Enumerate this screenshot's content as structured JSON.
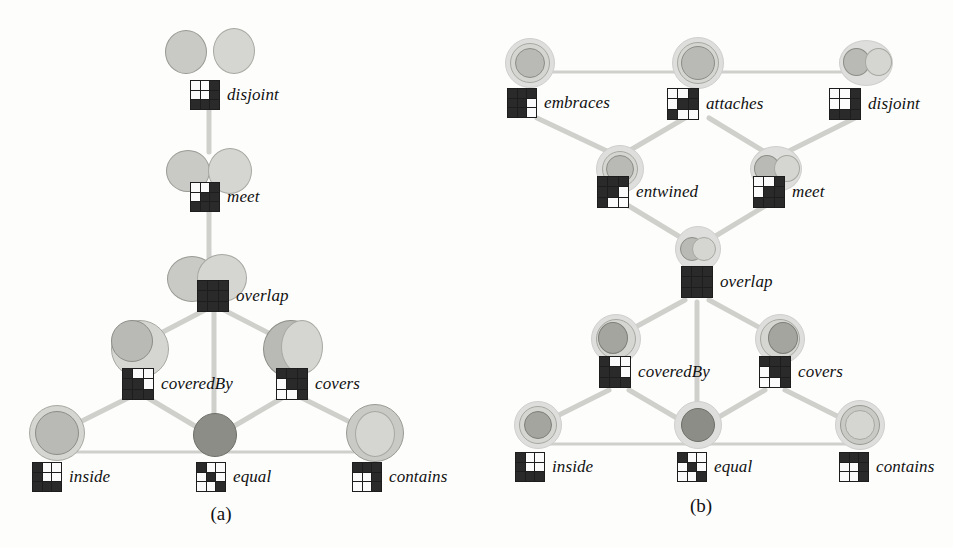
{
  "figure": {
    "panels": [
      {
        "id": "a",
        "caption": "(a)",
        "nodes": [
          {
            "key": "disjoint",
            "label": "disjoint",
            "matrix": [
              [
                0,
                0,
                1
              ],
              [
                0,
                0,
                1
              ],
              [
                1,
                1,
                1
              ]
            ]
          },
          {
            "key": "meet",
            "label": "meet",
            "matrix": [
              [
                0,
                0,
                1
              ],
              [
                0,
                1,
                1
              ],
              [
                1,
                1,
                1
              ]
            ]
          },
          {
            "key": "overlap",
            "label": "overlap",
            "matrix": [
              [
                1,
                1,
                1
              ],
              [
                1,
                1,
                1
              ],
              [
                1,
                1,
                1
              ]
            ]
          },
          {
            "key": "coveredBy",
            "label": "coveredBy",
            "matrix": [
              [
                1,
                0,
                0
              ],
              [
                1,
                1,
                0
              ],
              [
                1,
                1,
                1
              ]
            ]
          },
          {
            "key": "covers",
            "label": "covers",
            "matrix": [
              [
                1,
                1,
                1
              ],
              [
                0,
                1,
                1
              ],
              [
                0,
                0,
                1
              ]
            ]
          },
          {
            "key": "inside",
            "label": "inside",
            "matrix": [
              [
                1,
                0,
                0
              ],
              [
                1,
                0,
                0
              ],
              [
                1,
                1,
                1
              ]
            ]
          },
          {
            "key": "equal",
            "label": "equal",
            "matrix": [
              [
                1,
                0,
                0
              ],
              [
                0,
                1,
                0
              ],
              [
                0,
                0,
                1
              ]
            ]
          },
          {
            "key": "contains",
            "label": "contains",
            "matrix": [
              [
                1,
                1,
                1
              ],
              [
                0,
                0,
                1
              ],
              [
                0,
                0,
                1
              ]
            ]
          }
        ],
        "edges": [
          {
            "from": "disjoint",
            "to": "meet"
          },
          {
            "from": "meet",
            "to": "overlap"
          },
          {
            "from": "overlap",
            "to": "coveredBy"
          },
          {
            "from": "overlap",
            "to": "covers"
          },
          {
            "from": "overlap",
            "to": "equal"
          },
          {
            "from": "coveredBy",
            "to": "inside"
          },
          {
            "from": "coveredBy",
            "to": "equal"
          },
          {
            "from": "covers",
            "to": "contains"
          },
          {
            "from": "covers",
            "to": "equal"
          },
          {
            "from": "inside",
            "to": "equal"
          },
          {
            "from": "equal",
            "to": "contains"
          }
        ]
      },
      {
        "id": "b",
        "caption": "(b)",
        "nodes": [
          {
            "key": "embraces",
            "label": "embraces",
            "matrix": [
              [
                1,
                1,
                1
              ],
              [
                1,
                1,
                0
              ],
              [
                1,
                1,
                0
              ]
            ]
          },
          {
            "key": "attaches",
            "label": "attaches",
            "matrix": [
              [
                0,
                0,
                1
              ],
              [
                0,
                1,
                1
              ],
              [
                1,
                0,
                0
              ]
            ]
          },
          {
            "key": "disjoint",
            "label": "disjoint",
            "matrix": [
              [
                0,
                0,
                1
              ],
              [
                0,
                0,
                1
              ],
              [
                1,
                1,
                1
              ]
            ]
          },
          {
            "key": "entwined",
            "label": "entwined",
            "matrix": [
              [
                1,
                1,
                1
              ],
              [
                1,
                1,
                0
              ],
              [
                1,
                0,
                0
              ]
            ]
          },
          {
            "key": "meet",
            "label": "meet",
            "matrix": [
              [
                0,
                0,
                1
              ],
              [
                0,
                1,
                1
              ],
              [
                1,
                1,
                1
              ]
            ]
          },
          {
            "key": "overlap",
            "label": "overlap",
            "matrix": [
              [
                1,
                1,
                1
              ],
              [
                1,
                1,
                1
              ],
              [
                1,
                1,
                1
              ]
            ]
          },
          {
            "key": "coveredBy",
            "label": "coveredBy",
            "matrix": [
              [
                1,
                0,
                0
              ],
              [
                1,
                1,
                0
              ],
              [
                1,
                1,
                1
              ]
            ]
          },
          {
            "key": "covers",
            "label": "covers",
            "matrix": [
              [
                1,
                1,
                1
              ],
              [
                0,
                1,
                1
              ],
              [
                0,
                0,
                1
              ]
            ]
          },
          {
            "key": "inside",
            "label": "inside",
            "matrix": [
              [
                1,
                0,
                0
              ],
              [
                1,
                0,
                0
              ],
              [
                1,
                1,
                1
              ]
            ]
          },
          {
            "key": "equal",
            "label": "equal",
            "matrix": [
              [
                1,
                0,
                0
              ],
              [
                0,
                1,
                0
              ],
              [
                0,
                0,
                1
              ]
            ]
          },
          {
            "key": "contains",
            "label": "contains",
            "matrix": [
              [
                1,
                1,
                1
              ],
              [
                0,
                0,
                1
              ],
              [
                0,
                0,
                1
              ]
            ]
          }
        ],
        "edges": [
          {
            "from": "embraces",
            "to": "attaches"
          },
          {
            "from": "attaches",
            "to": "disjoint"
          },
          {
            "from": "embraces",
            "to": "entwined"
          },
          {
            "from": "attaches",
            "to": "entwined"
          },
          {
            "from": "attaches",
            "to": "meet"
          },
          {
            "from": "disjoint",
            "to": "meet"
          },
          {
            "from": "entwined",
            "to": "overlap"
          },
          {
            "from": "meet",
            "to": "overlap"
          },
          {
            "from": "overlap",
            "to": "coveredBy"
          },
          {
            "from": "overlap",
            "to": "covers"
          },
          {
            "from": "overlap",
            "to": "equal"
          },
          {
            "from": "coveredBy",
            "to": "inside"
          },
          {
            "from": "coveredBy",
            "to": "equal"
          },
          {
            "from": "covers",
            "to": "contains"
          },
          {
            "from": "covers",
            "to": "equal"
          },
          {
            "from": "inside",
            "to": "equal"
          },
          {
            "from": "equal",
            "to": "contains"
          }
        ]
      }
    ]
  },
  "colors": {
    "edge": "#cfcfcb",
    "matrix_on": "#2a2a2a",
    "matrix_off": "#fbfbfb",
    "region_fill": "#bdbdb8",
    "halo": "#dededc",
    "text": "#111111"
  }
}
